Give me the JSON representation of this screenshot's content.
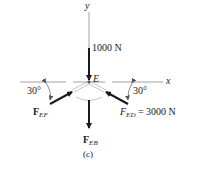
{
  "diagram": {
    "type": "free-body diagram",
    "point_label": "E",
    "axes": {
      "x_label": "x",
      "y_label": "y"
    },
    "forces": [
      {
        "id": "applied",
        "label": "1000 N",
        "direction": "down"
      },
      {
        "id": "FEF",
        "symbol": "F",
        "subscript": "EF",
        "direction": "up-right toward E",
        "angle_label": "30°"
      },
      {
        "id": "FED",
        "symbol": "F",
        "subscript": "ED",
        "value_text": " = 3000 N",
        "direction": "up-left toward E",
        "angle_label": "30°"
      },
      {
        "id": "FEB",
        "symbol": "F",
        "subscript": "EB",
        "direction": "down"
      }
    ],
    "caption": "(c)"
  },
  "colors": {
    "ink": "#1a1a1a",
    "axis": "#8a8a8a",
    "member": "#b5b5b5"
  }
}
